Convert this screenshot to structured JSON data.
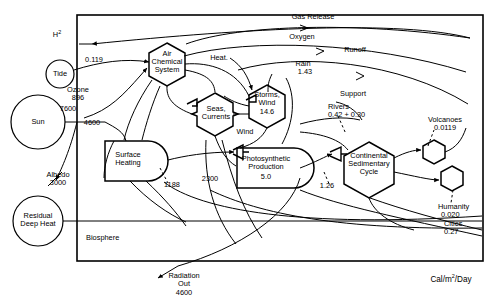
{
  "diagram": {
    "units_label": "Cal/m2/Day",
    "boundary_label": "Biosphere",
    "stroke_color": "#000000",
    "background_color": "#ffffff"
  },
  "external_sources": [
    {
      "name": "sun-source",
      "label": "Sun",
      "shape": "circle"
    },
    {
      "name": "tide-source",
      "label": "Tide",
      "shape": "circle"
    },
    {
      "name": "residual-deep-heat-source",
      "label": "Residual\nDeep Heat",
      "shape": "circle"
    }
  ],
  "storages": [
    {
      "name": "air-chemical-system",
      "label": "Air\nChemical\nSystem",
      "value": "",
      "shape": "hexagon"
    },
    {
      "name": "seas-currents",
      "label": "Seas,\nCurrents",
      "value": "",
      "shape": "hexagon"
    },
    {
      "name": "storms-wind",
      "label": "Storms,\nWind",
      "value": "14.6",
      "shape": "hexagon"
    },
    {
      "name": "continental-sedimentary-cycle",
      "label": "Continental\nSedimentary\nCycle",
      "value": "",
      "shape": "hexagon"
    },
    {
      "name": "volcanoes-hexagon",
      "label": "",
      "value": "",
      "shape": "hexagon"
    },
    {
      "name": "humanity-hexagon",
      "label": "",
      "value": "",
      "shape": "hexagon"
    },
    {
      "name": "surface-heating",
      "label": "Surface\nHeating",
      "value": "",
      "shape": "bullet"
    },
    {
      "name": "photosynthetic-production",
      "label": "Photosynthetic\nProduction",
      "value": "5.0",
      "shape": "bullet"
    }
  ],
  "flow_labels": [
    {
      "name": "gas-release-label",
      "text": "Gas Release"
    },
    {
      "name": "oxygen-label",
      "text": "Oxygen"
    },
    {
      "name": "runoff-label",
      "text": "Runoff"
    },
    {
      "name": "heat-label",
      "text": "Heat."
    },
    {
      "name": "wind-label",
      "text": "Wind"
    },
    {
      "name": "support-label",
      "text": "Support"
    },
    {
      "name": "hydrogen-label",
      "text": "H",
      "superscript": "2"
    }
  ],
  "valued_flows": [
    {
      "name": "tide-flow",
      "label": "",
      "value": "0.119"
    },
    {
      "name": "ozone-flow",
      "label": "Ozone",
      "value": "896"
    },
    {
      "name": "sun-insolation-flow",
      "label": "",
      "value": "7600"
    },
    {
      "name": "sun-absorbed-flow",
      "label": "",
      "value": "4600"
    },
    {
      "name": "albedo-flow",
      "label": "Albedo",
      "value": "3000"
    },
    {
      "name": "rain-flow",
      "label": "Rain",
      "value": "1.43"
    },
    {
      "name": "rivers-flow",
      "label": "Rivers",
      "value": "0.42 + 0.30"
    },
    {
      "name": "volcanoes-flow",
      "label": "Volcanoes",
      "value": "0.0119"
    },
    {
      "name": "humanity-flow",
      "label": "Humanity",
      "value": "0.020"
    },
    {
      "name": "cities-flow",
      "label": "Cities",
      "value": "0.27"
    },
    {
      "name": "surface-heat-flow",
      "label": "",
      "value": "1188"
    },
    {
      "name": "photosynthesis-input-flow",
      "label": "",
      "value": "2300"
    },
    {
      "name": "sedimentary-flow",
      "label": "",
      "value": "1.26"
    },
    {
      "name": "radiation-out-flow",
      "label": "Radiation\nOut",
      "value": "4600"
    }
  ]
}
